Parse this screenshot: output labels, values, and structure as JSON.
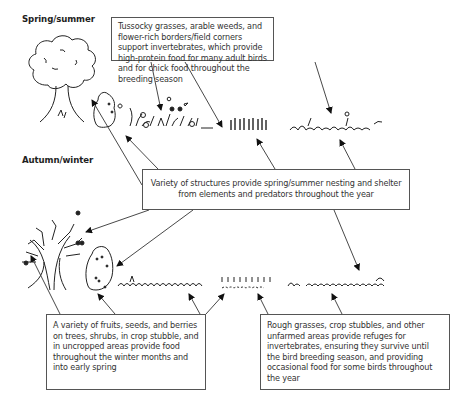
{
  "figure": {
    "type": "schematic-illustration"
  },
  "sections": {
    "spring_summer": {
      "label": "Spring/summer"
    },
    "autumn_winter": {
      "label": "Autumn/winter"
    }
  },
  "callouts": {
    "invertebrate_food": {
      "text": "Tussocky grasses, arable weeds, and flower-rich borders/field corners support invertebrates, which provide high-protein food for many adult birds and for chick food throughout the breeding season"
    },
    "nesting_shelter": {
      "text": "Variety of structures provide spring/summer nesting and shelter from elements and predators throughout the year"
    },
    "winter_food": {
      "text": "A variety of fruits, seeds, and berries on trees, shrubs, in crop stubble, and in uncropped areas provide food throughout the winter months and into early spring"
    },
    "refuges": {
      "text": "Rough grasses, crop stubbles, and other unfarmed areas provide refuges for invertebrates, ensuring they survive until the bird breeding season, and providing occasional food for some birds throughout the year"
    }
  },
  "illustrations": {
    "spring_summer": [
      "leafy-tree",
      "hedge-shrub",
      "flowering-weeds",
      "tussocky-grass",
      "rough-grass"
    ],
    "autumn_winter": [
      "bare-tree-with-fruit",
      "berry-shrub",
      "weedy-stubble",
      "crop-stubble",
      "rough-grass"
    ]
  },
  "colors": {
    "background": "#ffffff",
    "line": "#222222",
    "box_border": "#555555",
    "text": "#333333"
  }
}
